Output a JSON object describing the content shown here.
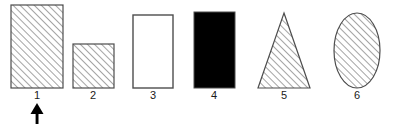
{
  "figure": {
    "type": "shape-comparison-diagram",
    "background_color": "#ffffff",
    "outline_color": "#4d4d4d",
    "hatch_color": "#595959",
    "fill_black": "#000000",
    "fill_white": "#ffffff",
    "label_color": "#1a1a1a",
    "arrow_color": "#000000",
    "baseline_y": 88,
    "shapes": [
      {
        "label": "1",
        "kind": "rectangle",
        "fill_style": "diagonal-hatch",
        "x": 11,
        "y": 5,
        "width": 52,
        "height": 83,
        "label_x": 37,
        "label_y": 99,
        "marked": true
      },
      {
        "label": "2",
        "kind": "square",
        "fill_style": "diagonal-hatch",
        "x": 73,
        "y": 44,
        "width": 41,
        "height": 44,
        "label_x": 93,
        "label_y": 99,
        "marked": false
      },
      {
        "label": "3",
        "kind": "rectangle",
        "fill_style": "empty",
        "x": 133,
        "y": 15,
        "width": 40,
        "height": 73,
        "label_x": 153,
        "label_y": 99,
        "marked": false
      },
      {
        "label": "4",
        "kind": "rectangle",
        "fill_style": "solid-black",
        "x": 194,
        "y": 12,
        "width": 41,
        "height": 76,
        "label_x": 214,
        "label_y": 99,
        "marked": false
      },
      {
        "label": "5",
        "kind": "triangle",
        "fill_style": "diagonal-hatch",
        "x": 258,
        "y": 13,
        "width": 52,
        "height": 75,
        "label_x": 284,
        "label_y": 99,
        "marked": false
      },
      {
        "label": "6",
        "kind": "ellipse",
        "fill_style": "diagonal-hatch",
        "cx": 357,
        "cy": 50,
        "rx": 23,
        "ry": 38,
        "label_x": 357,
        "label_y": 99,
        "marked": false
      }
    ],
    "pointer": {
      "name": "arrow-marker",
      "points_to_label": "1",
      "direction": "up",
      "tip_x": 37,
      "tip_y": 103,
      "tail_y": 124,
      "head_half_width": 6,
      "head_height": 11,
      "shaft_width": 3
    }
  }
}
